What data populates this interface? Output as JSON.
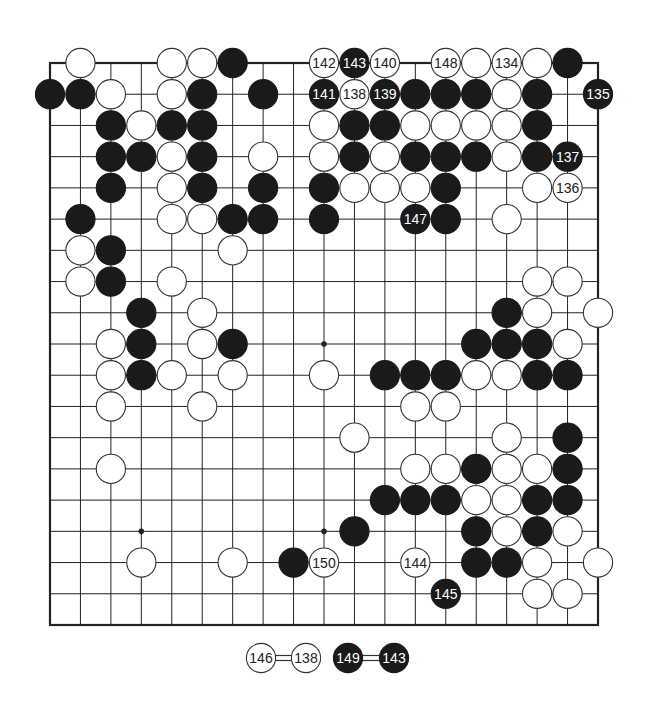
{
  "diagram": {
    "type": "go-board",
    "size": 19,
    "star_points": [
      [
        3,
        3
      ],
      [
        3,
        9
      ],
      [
        3,
        15
      ],
      [
        9,
        3
      ],
      [
        9,
        9
      ],
      [
        9,
        15
      ],
      [
        15,
        3
      ],
      [
        15,
        9
      ],
      [
        15,
        15
      ]
    ],
    "colors": {
      "black": "#1a1a1a",
      "white": "#ffffff",
      "line": "#222222",
      "edge": "#222222",
      "label_on_black": "#ffffff",
      "label_on_white": "#222222"
    },
    "stones": [
      {
        "r": 0,
        "c": 1,
        "color": "W"
      },
      {
        "r": 0,
        "c": 4,
        "color": "W"
      },
      {
        "r": 0,
        "c": 5,
        "color": "W"
      },
      {
        "r": 0,
        "c": 6,
        "color": "B"
      },
      {
        "r": 0,
        "c": 9,
        "color": "W",
        "label": "142"
      },
      {
        "r": 0,
        "c": 10,
        "color": "B",
        "label": "143"
      },
      {
        "r": 0,
        "c": 11,
        "color": "W",
        "label": "140"
      },
      {
        "r": 0,
        "c": 13,
        "color": "W",
        "label": "148"
      },
      {
        "r": 0,
        "c": 14,
        "color": "W"
      },
      {
        "r": 0,
        "c": 15,
        "color": "W",
        "label": "134"
      },
      {
        "r": 0,
        "c": 16,
        "color": "W"
      },
      {
        "r": 0,
        "c": 17,
        "color": "B"
      },
      {
        "r": 1,
        "c": 0,
        "color": "B"
      },
      {
        "r": 1,
        "c": 1,
        "color": "B"
      },
      {
        "r": 1,
        "c": 2,
        "color": "W"
      },
      {
        "r": 1,
        "c": 4,
        "color": "W"
      },
      {
        "r": 1,
        "c": 5,
        "color": "B"
      },
      {
        "r": 1,
        "c": 7,
        "color": "B"
      },
      {
        "r": 1,
        "c": 9,
        "color": "B",
        "label": "141"
      },
      {
        "r": 1,
        "c": 10,
        "color": "W",
        "label": "138"
      },
      {
        "r": 1,
        "c": 11,
        "color": "B",
        "label": "139"
      },
      {
        "r": 1,
        "c": 12,
        "color": "B"
      },
      {
        "r": 1,
        "c": 13,
        "color": "B"
      },
      {
        "r": 1,
        "c": 14,
        "color": "B"
      },
      {
        "r": 1,
        "c": 15,
        "color": "W"
      },
      {
        "r": 1,
        "c": 16,
        "color": "B"
      },
      {
        "r": 1,
        "c": 18,
        "color": "B",
        "label": "135"
      },
      {
        "r": 2,
        "c": 2,
        "color": "B"
      },
      {
        "r": 2,
        "c": 3,
        "color": "W"
      },
      {
        "r": 2,
        "c": 4,
        "color": "B"
      },
      {
        "r": 2,
        "c": 5,
        "color": "B"
      },
      {
        "r": 2,
        "c": 9,
        "color": "W"
      },
      {
        "r": 2,
        "c": 10,
        "color": "B"
      },
      {
        "r": 2,
        "c": 11,
        "color": "B"
      },
      {
        "r": 2,
        "c": 12,
        "color": "W"
      },
      {
        "r": 2,
        "c": 13,
        "color": "W"
      },
      {
        "r": 2,
        "c": 14,
        "color": "W"
      },
      {
        "r": 2,
        "c": 15,
        "color": "W"
      },
      {
        "r": 2,
        "c": 16,
        "color": "B"
      },
      {
        "r": 3,
        "c": 2,
        "color": "B"
      },
      {
        "r": 3,
        "c": 3,
        "color": "B"
      },
      {
        "r": 3,
        "c": 4,
        "color": "W"
      },
      {
        "r": 3,
        "c": 5,
        "color": "B"
      },
      {
        "r": 3,
        "c": 7,
        "color": "W"
      },
      {
        "r": 3,
        "c": 9,
        "color": "W"
      },
      {
        "r": 3,
        "c": 10,
        "color": "B"
      },
      {
        "r": 3,
        "c": 11,
        "color": "W"
      },
      {
        "r": 3,
        "c": 12,
        "color": "B"
      },
      {
        "r": 3,
        "c": 13,
        "color": "B"
      },
      {
        "r": 3,
        "c": 14,
        "color": "B"
      },
      {
        "r": 3,
        "c": 15,
        "color": "W"
      },
      {
        "r": 3,
        "c": 16,
        "color": "B"
      },
      {
        "r": 3,
        "c": 17,
        "color": "B",
        "label": "137"
      },
      {
        "r": 4,
        "c": 2,
        "color": "B"
      },
      {
        "r": 4,
        "c": 4,
        "color": "W"
      },
      {
        "r": 4,
        "c": 5,
        "color": "B"
      },
      {
        "r": 4,
        "c": 7,
        "color": "B"
      },
      {
        "r": 4,
        "c": 9,
        "color": "B"
      },
      {
        "r": 4,
        "c": 10,
        "color": "W"
      },
      {
        "r": 4,
        "c": 11,
        "color": "W"
      },
      {
        "r": 4,
        "c": 12,
        "color": "W"
      },
      {
        "r": 4,
        "c": 13,
        "color": "B"
      },
      {
        "r": 4,
        "c": 16,
        "color": "W"
      },
      {
        "r": 4,
        "c": 17,
        "color": "W",
        "label": "136"
      },
      {
        "r": 5,
        "c": 1,
        "color": "B"
      },
      {
        "r": 5,
        "c": 4,
        "color": "W"
      },
      {
        "r": 5,
        "c": 5,
        "color": "W"
      },
      {
        "r": 5,
        "c": 6,
        "color": "B"
      },
      {
        "r": 5,
        "c": 7,
        "color": "B"
      },
      {
        "r": 5,
        "c": 9,
        "color": "B"
      },
      {
        "r": 5,
        "c": 12,
        "color": "B",
        "label": "147"
      },
      {
        "r": 5,
        "c": 13,
        "color": "B"
      },
      {
        "r": 5,
        "c": 15,
        "color": "W"
      },
      {
        "r": 6,
        "c": 1,
        "color": "W"
      },
      {
        "r": 6,
        "c": 2,
        "color": "B"
      },
      {
        "r": 6,
        "c": 6,
        "color": "W"
      },
      {
        "r": 7,
        "c": 1,
        "color": "W"
      },
      {
        "r": 7,
        "c": 2,
        "color": "B"
      },
      {
        "r": 7,
        "c": 4,
        "color": "W"
      },
      {
        "r": 7,
        "c": 16,
        "color": "W"
      },
      {
        "r": 7,
        "c": 17,
        "color": "W"
      },
      {
        "r": 8,
        "c": 3,
        "color": "B"
      },
      {
        "r": 8,
        "c": 5,
        "color": "W"
      },
      {
        "r": 8,
        "c": 15,
        "color": "B"
      },
      {
        "r": 8,
        "c": 16,
        "color": "W"
      },
      {
        "r": 8,
        "c": 18,
        "color": "W"
      },
      {
        "r": 9,
        "c": 2,
        "color": "W"
      },
      {
        "r": 9,
        "c": 3,
        "color": "B"
      },
      {
        "r": 9,
        "c": 5,
        "color": "W"
      },
      {
        "r": 9,
        "c": 6,
        "color": "B"
      },
      {
        "r": 9,
        "c": 14,
        "color": "B"
      },
      {
        "r": 9,
        "c": 15,
        "color": "B"
      },
      {
        "r": 9,
        "c": 16,
        "color": "B"
      },
      {
        "r": 9,
        "c": 17,
        "color": "W"
      },
      {
        "r": 10,
        "c": 2,
        "color": "W"
      },
      {
        "r": 10,
        "c": 3,
        "color": "B"
      },
      {
        "r": 10,
        "c": 4,
        "color": "W"
      },
      {
        "r": 10,
        "c": 6,
        "color": "W"
      },
      {
        "r": 10,
        "c": 9,
        "color": "W"
      },
      {
        "r": 10,
        "c": 11,
        "color": "B"
      },
      {
        "r": 10,
        "c": 12,
        "color": "B"
      },
      {
        "r": 10,
        "c": 13,
        "color": "B"
      },
      {
        "r": 10,
        "c": 14,
        "color": "W"
      },
      {
        "r": 10,
        "c": 15,
        "color": "W"
      },
      {
        "r": 10,
        "c": 16,
        "color": "B"
      },
      {
        "r": 10,
        "c": 17,
        "color": "B"
      },
      {
        "r": 11,
        "c": 2,
        "color": "W"
      },
      {
        "r": 11,
        "c": 5,
        "color": "W"
      },
      {
        "r": 11,
        "c": 12,
        "color": "W"
      },
      {
        "r": 11,
        "c": 13,
        "color": "W"
      },
      {
        "r": 12,
        "c": 10,
        "color": "W"
      },
      {
        "r": 12,
        "c": 15,
        "color": "W"
      },
      {
        "r": 12,
        "c": 17,
        "color": "B"
      },
      {
        "r": 13,
        "c": 2,
        "color": "W"
      },
      {
        "r": 13,
        "c": 12,
        "color": "W"
      },
      {
        "r": 13,
        "c": 13,
        "color": "W"
      },
      {
        "r": 13,
        "c": 14,
        "color": "B"
      },
      {
        "r": 13,
        "c": 15,
        "color": "W"
      },
      {
        "r": 13,
        "c": 16,
        "color": "W"
      },
      {
        "r": 13,
        "c": 17,
        "color": "B"
      },
      {
        "r": 14,
        "c": 11,
        "color": "B"
      },
      {
        "r": 14,
        "c": 12,
        "color": "B"
      },
      {
        "r": 14,
        "c": 13,
        "color": "B"
      },
      {
        "r": 14,
        "c": 14,
        "color": "W"
      },
      {
        "r": 14,
        "c": 15,
        "color": "W"
      },
      {
        "r": 14,
        "c": 16,
        "color": "B"
      },
      {
        "r": 14,
        "c": 17,
        "color": "B"
      },
      {
        "r": 15,
        "c": 10,
        "color": "B"
      },
      {
        "r": 15,
        "c": 14,
        "color": "B"
      },
      {
        "r": 15,
        "c": 15,
        "color": "W"
      },
      {
        "r": 15,
        "c": 16,
        "color": "B"
      },
      {
        "r": 15,
        "c": 17,
        "color": "W"
      },
      {
        "r": 16,
        "c": 3,
        "color": "W"
      },
      {
        "r": 16,
        "c": 6,
        "color": "W"
      },
      {
        "r": 16,
        "c": 8,
        "color": "B"
      },
      {
        "r": 16,
        "c": 9,
        "color": "W",
        "label": "150"
      },
      {
        "r": 16,
        "c": 12,
        "color": "W",
        "label": "144"
      },
      {
        "r": 16,
        "c": 14,
        "color": "B"
      },
      {
        "r": 16,
        "c": 15,
        "color": "B"
      },
      {
        "r": 16,
        "c": 16,
        "color": "W"
      },
      {
        "r": 16,
        "c": 18,
        "color": "W"
      },
      {
        "r": 17,
        "c": 13,
        "color": "B",
        "label": "145"
      },
      {
        "r": 17,
        "c": 16,
        "color": "W"
      },
      {
        "r": 17,
        "c": 17,
        "color": "W"
      }
    ],
    "caption": [
      {
        "stone": {
          "color": "W",
          "label": "146"
        },
        "equals": {
          "color": "W",
          "label": "138"
        }
      },
      {
        "stone": {
          "color": "B",
          "label": "149"
        },
        "equals": {
          "color": "B",
          "label": "143"
        }
      }
    ]
  }
}
